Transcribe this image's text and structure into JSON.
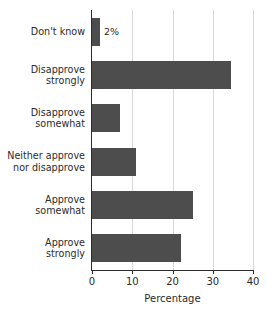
{
  "chart_data": {
    "type": "bar",
    "orientation": "horizontal",
    "title": "",
    "xlabel": "Percentage",
    "ylabel": "",
    "xlim": [
      0,
      40
    ],
    "xticks": [
      0,
      10,
      20,
      30,
      40
    ],
    "grid": "vertical",
    "legend": "none",
    "bar_color": "#4d4d4d",
    "grid_color": "#d8d8d8",
    "axis_color": "#2b2b2b",
    "background": "#ffffff",
    "categories": [
      "Don't know",
      "Disapprove\nstrongly",
      "Disapprove\nsomewhat",
      "Neither approve\nnor disapprove",
      "Approve\nsomewhat",
      "Approve\nstrongly"
    ],
    "values": [
      2,
      34.5,
      7,
      11,
      25,
      22
    ],
    "annotations": [
      {
        "category": "Don't know",
        "text": "2%"
      }
    ]
  }
}
